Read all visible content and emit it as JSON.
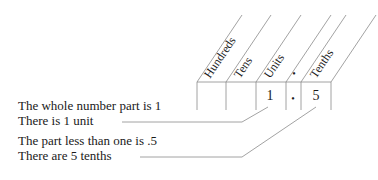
{
  "headers": [
    "Hundreds",
    "Tens",
    "Units",
    "•",
    "Tenths"
  ],
  "cells": [
    "",
    "",
    "1",
    "•",
    "5"
  ],
  "annotations": [
    {
      "line1": "The whole number part is 1",
      "line2": "There is 1 unit"
    },
    {
      "line1": "The part less than one is .5",
      "line2": "There are 5 tenths"
    }
  ],
  "colors": {
    "line": "#8a8a8a",
    "text": "#1a1a1a"
  }
}
